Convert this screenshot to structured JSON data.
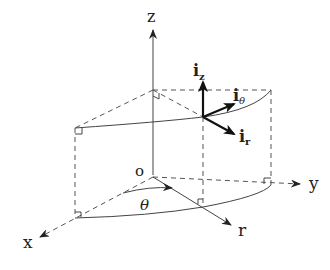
{
  "diagram": {
    "axes": {
      "z_label": "z",
      "y_label": "y",
      "x_label": "x",
      "r_label": "r",
      "origin_label": "o",
      "angle_label": "θ"
    },
    "unit_vectors": {
      "iz": {
        "base": "i",
        "sub": "z"
      },
      "itheta": {
        "base": "i",
        "sub": "θ"
      },
      "ir": {
        "base": "i",
        "sub": "r"
      }
    },
    "colors": {
      "line": "#444444",
      "vector": "#111111",
      "background": "#ffffff"
    }
  }
}
